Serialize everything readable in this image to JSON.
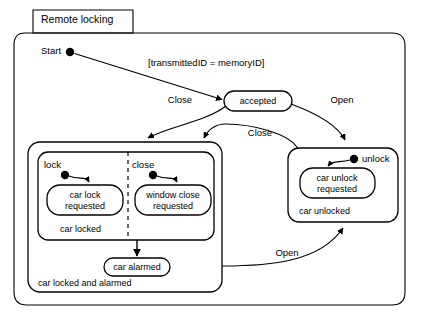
{
  "diagram": {
    "type": "uml-state-machine-diagram",
    "frame_title": "Remote locking",
    "initial_label": "Start",
    "guard_condition": "[transmittedID = memoryID]",
    "states": {
      "accepted": "accepted",
      "car_lock_requested": "car lock\nrequested",
      "car_lock_requested_line1": "car lock",
      "car_lock_requested_line2": "requested",
      "window_close_requested_line1": "window close",
      "window_close_requested_line2": "requested",
      "car_alarmed": "car alarmed",
      "car_unlock_requested_line1": "car unlock",
      "car_unlock_requested_line2": "requested"
    },
    "composite_states": {
      "car_locked": "car locked",
      "car_locked_and_alarmed": "car locked and alarmed",
      "car_unlocked": "car unlocked"
    },
    "pseudo_state_labels": {
      "lock": "lock",
      "close": "close",
      "unlock": "unlock"
    },
    "transitions": [
      {
        "label": "Close",
        "from": "accepted",
        "to": "car locked and alarmed"
      },
      {
        "label": "Open",
        "from": "accepted",
        "to": "car unlocked"
      },
      {
        "label": "Close",
        "from": "car unlocked",
        "to": "car locked and alarmed"
      },
      {
        "label": "Open",
        "from": "car locked and alarmed",
        "to": "car unlocked"
      }
    ],
    "transition_labels": {
      "close_top": "Close",
      "open_top": "Open",
      "close_mid": "Close",
      "open_bottom": "Open"
    },
    "colors": {
      "stroke": "#000000",
      "fill": "#ffffff",
      "text": "#000000"
    }
  }
}
